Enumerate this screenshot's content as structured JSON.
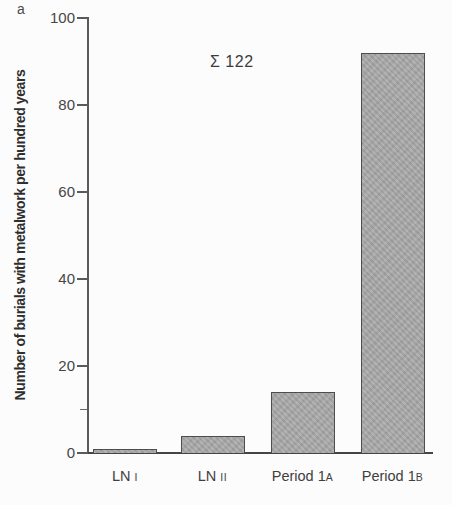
{
  "figure": {
    "panel_label": "a",
    "annotation": "Σ 122",
    "y_axis": {
      "title": "Number of burials with metalwork per hundred years",
      "tick_labels": [
        "0",
        "20",
        "40",
        "60",
        "80",
        "100"
      ],
      "minor_tick_values": [
        10
      ],
      "range": [
        0,
        100
      ]
    },
    "colors": {
      "bar_fill": "#a9a9a9",
      "bar_border": "#4d4d4d",
      "axis": "#5a5a5a",
      "text": "#3a3a3a",
      "background": "#fcfcfc"
    }
  },
  "chart_data": {
    "type": "bar",
    "title": "",
    "xlabel": "",
    "ylabel": "Number of burials with metalwork per hundred years",
    "categories": [
      "LN I",
      "LN II",
      "Period 1A",
      "Period 1B"
    ],
    "category_parts": [
      {
        "main": "LN ",
        "suffix": "I"
      },
      {
        "main": "LN ",
        "suffix": "II"
      },
      {
        "main": "Period 1",
        "suffix": "A"
      },
      {
        "main": "Period 1",
        "suffix": "B"
      }
    ],
    "values": [
      1,
      4,
      14,
      92
    ],
    "ylim": [
      0,
      100
    ],
    "yticks": [
      0,
      20,
      40,
      60,
      80,
      100
    ],
    "annotation": "Σ 122",
    "grid": false,
    "legend_position": "none"
  }
}
